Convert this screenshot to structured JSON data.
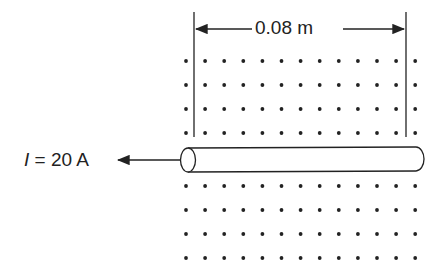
{
  "diagram": {
    "width_label": "0.08 m",
    "current_label": "I = 20 A",
    "current_symbol": "I",
    "current_value": "= 20 A",
    "field": {
      "symbol": "dot",
      "meaning": "magnetic field out of page",
      "columns": 13,
      "rows_above": 4,
      "rows_below": 4
    },
    "wire": {
      "shape": "cylinder-rod",
      "current_direction": "left"
    },
    "colors": {
      "ink": "#222222",
      "background": "#ffffff"
    }
  }
}
